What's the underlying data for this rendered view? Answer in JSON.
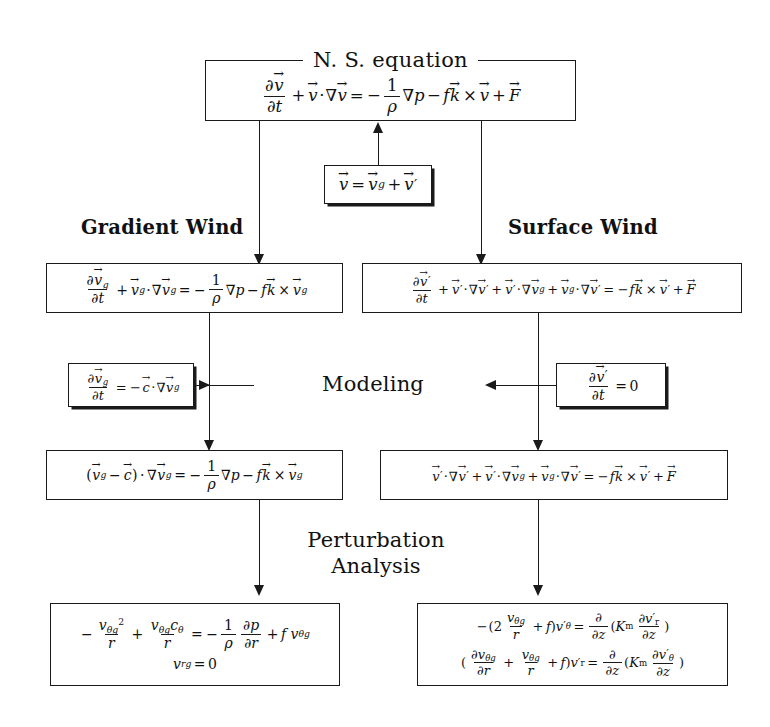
{
  "diagram": {
    "title": "N. S. equation",
    "ink_color": "#1a1a1a",
    "background_color": "#ffffff"
  },
  "nodes": {
    "ns_equation": {
      "legend": "N. S. equation",
      "equation_text": "∂v⃗/∂t + v⃗·∇v⃗ = −(1/ρ)∇p − f k⃗ × v⃗ + F⃗"
    },
    "decomposition": {
      "equation_text": "v⃗ = v⃗_g + v⃗′"
    },
    "gradient_wind_heading": "Gradient Wind",
    "surface_wind_heading": "Surface Wind",
    "gradient_wind_eq": {
      "equation_text": "∂v⃗_g/∂t + v⃗_g·∇v⃗_g = −(1/ρ)∇p − f k⃗ × v⃗_g"
    },
    "surface_wind_eq": {
      "equation_text": "∂v⃗′/∂t + v⃗′·∇v⃗′ + v⃗′·∇v⃗_g + v⃗_g·∇v⃗′ = −f k⃗ × v⃗′ + F⃗"
    },
    "modeling_heading": "Modeling",
    "modeling_left": {
      "equation_text": "∂v⃗_g/∂t = −c⃗·∇v⃗_g"
    },
    "modeling_right": {
      "equation_text": "∂v⃗′/∂t = 0"
    },
    "gradient_wind_reduced": {
      "equation_text": "(v⃗_g − c⃗)·∇v⃗_g = −(1/ρ)∇p − f k⃗ × v⃗_g"
    },
    "surface_wind_reduced": {
      "equation_text": "v⃗′·∇v⃗′ + v⃗′·∇v⃗_g + v⃗_g·∇v⃗′ = −f k⃗ × v⃗′ + F⃗"
    },
    "perturbation_heading_line1": "Perturbation",
    "perturbation_heading_line2": "Analysis",
    "gradient_wind_final": {
      "line1": "−v_θg²/r + v_θg c_θ/r = −(1/ρ)∂p/∂r + f v_θg",
      "line2": "v_rg = 0"
    },
    "surface_wind_final": {
      "line1": "−(2 v_θg/r + f)v′_θ = ∂/∂z(K_m ∂v′_r/∂z)",
      "line2": "(∂v_θg/∂r + v_θg/r + f)v′_r = ∂/∂z(K_m ∂v′_θ/∂z)"
    }
  }
}
